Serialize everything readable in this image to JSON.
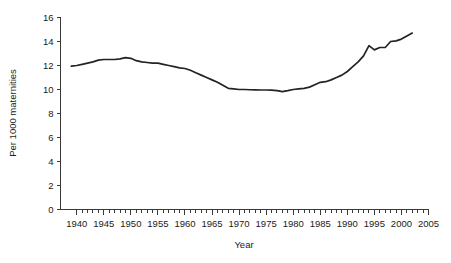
{
  "chart_data": {
    "type": "line",
    "title": "",
    "xlabel": "Year",
    "ylabel": "Per 1000 maternities",
    "xlim": [
      1937,
      2005
    ],
    "ylim": [
      0,
      16
    ],
    "grid": false,
    "legend": false,
    "legend_position": "none",
    "line_color": "#232323",
    "axis_color": "#3a3a3a",
    "background_color": "#ffffff",
    "x_major_ticks": [
      1940,
      1945,
      1950,
      1955,
      1960,
      1965,
      1970,
      1975,
      1980,
      1985,
      1990,
      1995,
      2000,
      2005
    ],
    "x_major_tick_labels": [
      "1940",
      "1945",
      "1950",
      "1955",
      "1960",
      "1965",
      "1970",
      "1975",
      "1980",
      "1985",
      "1990",
      "1995",
      "2000",
      "2005"
    ],
    "x_minor_tick_step": 1,
    "y_ticks": [
      0,
      2,
      4,
      6,
      8,
      10,
      12,
      14,
      16
    ],
    "y_tick_labels": [
      "0",
      "2",
      "4",
      "6",
      "8",
      "10",
      "12",
      "14",
      "16"
    ],
    "series": [
      {
        "name": "Per 1000 maternities",
        "x": [
          1939,
          1940,
          1941,
          1942,
          1943,
          1944,
          1945,
          1946,
          1947,
          1948,
          1949,
          1950,
          1951,
          1952,
          1953,
          1954,
          1955,
          1956,
          1957,
          1958,
          1959,
          1960,
          1961,
          1962,
          1963,
          1964,
          1965,
          1966,
          1967,
          1968,
          1969,
          1970,
          1971,
          1972,
          1973,
          1974,
          1975,
          1976,
          1977,
          1978,
          1979,
          1980,
          1981,
          1982,
          1983,
          1984,
          1985,
          1986,
          1987,
          1988,
          1989,
          1990,
          1991,
          1992,
          1993,
          1994,
          1995,
          1996,
          1997,
          1998,
          1999,
          2000,
          2001,
          2002
        ],
        "values": [
          11.95,
          12.0,
          12.1,
          12.2,
          12.3,
          12.45,
          12.5,
          12.5,
          12.5,
          12.55,
          12.65,
          12.6,
          12.4,
          12.3,
          12.25,
          12.2,
          12.2,
          12.1,
          12.0,
          11.9,
          11.8,
          11.75,
          11.6,
          11.4,
          11.2,
          11.0,
          10.8,
          10.6,
          10.35,
          10.1,
          10.05,
          10.0,
          10.0,
          9.98,
          9.97,
          9.96,
          9.96,
          9.95,
          9.9,
          9.82,
          9.9,
          10.0,
          10.05,
          10.1,
          10.2,
          10.4,
          10.6,
          10.65,
          10.8,
          11.0,
          11.2,
          11.5,
          11.9,
          12.3,
          12.8,
          13.65,
          13.3,
          13.5,
          13.5,
          14.0,
          14.05,
          14.2,
          14.45,
          14.7
        ]
      }
    ]
  },
  "labels": {
    "x_axis_title": "Year",
    "y_axis_title": "Per 1000 maternities"
  }
}
